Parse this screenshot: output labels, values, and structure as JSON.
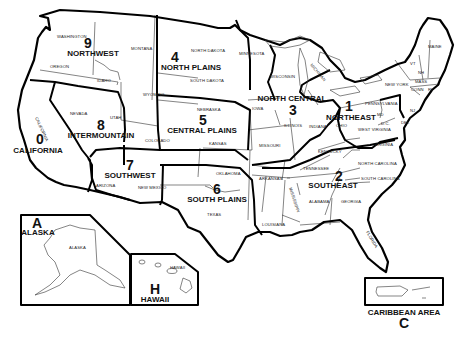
{
  "map": {
    "title": "US Regions Map",
    "regions": [
      {
        "number": "0",
        "name": "CALIFORNIA"
      },
      {
        "number": "1",
        "name": "NORTHEAST"
      },
      {
        "number": "2",
        "name": "SOUTHEAST"
      },
      {
        "number": "3",
        "name": "NORTH CENTRAL"
      },
      {
        "number": "4",
        "name": "NORTH PLAINS"
      },
      {
        "number": "5",
        "name": "CENTRAL PLAINS"
      },
      {
        "number": "6",
        "name": "SOUTH PLAINS"
      },
      {
        "number": "7",
        "name": "SOUTHWEST"
      },
      {
        "number": "8",
        "name": "INTERMOUNTAIN"
      },
      {
        "number": "9",
        "name": "NORTHWEST"
      },
      {
        "number": "A",
        "name": "ALASKA"
      },
      {
        "number": "H",
        "name": "HAWAII"
      },
      {
        "number": "C",
        "name": "CARIBBEAN AREA"
      }
    ],
    "states": {
      "washington": "WASHINGTON",
      "oregon": "OREGON",
      "idaho": "IDAHO",
      "montana": "MONTANA",
      "wyoming": "WYOMING",
      "california": "CALIFORNIA",
      "nevada": "NEVADA",
      "utah": "UTAH",
      "colorado": "COLORADO",
      "arizona": "ARIZONA",
      "new_mexico": "NEW MEXICO",
      "north_dakota": "NORTH DAKOTA",
      "south_dakota": "SOUTH DAKOTA",
      "nebraska": "NEBRASKA",
      "kansas": "KANSAS",
      "oklahoma": "OKLAHOMA",
      "texas": "TEXAS",
      "minnesota": "MINNESOTA",
      "wisconsin": "WISCONSIN",
      "michigan": "MICHIGAN",
      "iowa": "IOWA",
      "illinois": "ILLINOIS",
      "indiana": "INDIANA",
      "missouri": "MISSOURI",
      "arkansas": "ARKANSAS",
      "louisiana": "LOUISIANA",
      "mississippi": "MISSISSIPPI",
      "tennessee": "TENNESSEE",
      "kentucky": "KENTUCKY",
      "alabama": "ALABAMA",
      "georgia": "GEORGIA",
      "florida": "FLORIDA",
      "south_carolina": "SOUTH CAROLINA",
      "north_carolina": "NORTH CAROLINA",
      "virginia": "VIRGINIA",
      "west_virginia": "WEST VIRGINIA",
      "ohio": "OHIO",
      "pennsylvania": "PENNSYLVANIA",
      "new_york": "NEW YORK",
      "maine": "MAINE",
      "vermont": "VT",
      "new_hampshire": "NH",
      "massachusetts": "MASS",
      "connecticut": "CONN",
      "rhode_island": "RI",
      "new_jersey": "NJ",
      "delaware": "DEL",
      "maryland": "MD",
      "dc": "D.C.",
      "alaska": "ALASKA",
      "hawaii": "HAWAII"
    }
  }
}
